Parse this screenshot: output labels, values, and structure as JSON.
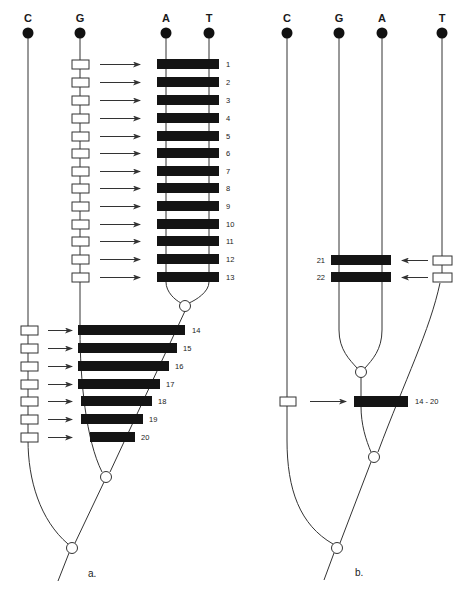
{
  "figure": {
    "panel_a": {
      "label": "a.",
      "bases": [
        "C",
        "G",
        "A",
        "T"
      ],
      "upper_bars": [
        "1",
        "2",
        "3",
        "4",
        "5",
        "6",
        "7",
        "8",
        "9",
        "10",
        "11",
        "12",
        "13"
      ],
      "lower_bars": [
        "14",
        "15",
        "16",
        "17",
        "18",
        "19",
        "20"
      ]
    },
    "panel_b": {
      "label": "b.",
      "bases": [
        "C",
        "G",
        "A",
        "T"
      ],
      "upper_bars": [
        "21",
        "22"
      ],
      "lower_bar": "14 - 20"
    }
  },
  "colors": {
    "line": "#333333",
    "bar": "#141414",
    "dot": "#111111",
    "background": "#ffffff"
  },
  "icons": {
    "root_node": "filled-circle",
    "junction_node": "open-circle",
    "event_box": "open-rectangle",
    "arrow": "right-arrow"
  }
}
